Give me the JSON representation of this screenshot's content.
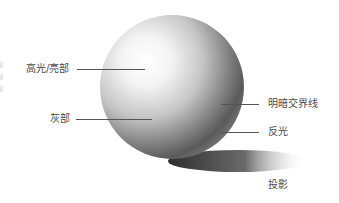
{
  "diagram": {
    "colors": {
      "background": "#ffffff",
      "text": "#4a4a4a",
      "leader_line": "#555555",
      "highlight": "#ffffff",
      "midtone": "#b8b8b8",
      "core_shadow": "#5c5c5c",
      "reflected_light": "#8a8a8a",
      "cast_shadow": "#3a3a3a"
    },
    "labels": {
      "highlight": "高光/亮部",
      "halftone": "灰部",
      "terminator": "明暗交界线",
      "reflected_light": "反光",
      "cast_shadow": "投影"
    }
  }
}
